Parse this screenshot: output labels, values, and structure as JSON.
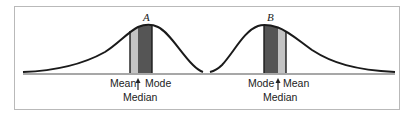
{
  "diagram": {
    "title": "",
    "colors": {
      "curve": "#1a1a1a",
      "baseline": "#8a8a8a",
      "mode_band": "#555555",
      "mean_band": "#c4c4c4",
      "frame": "#b9b9b9"
    },
    "curves": [
      {
        "id": "A",
        "label": "A",
        "skew": "negative (left-skewed)",
        "order_left_to_right": [
          "Mean",
          "Median",
          "Mode"
        ],
        "labels": {
          "mean": "Mean",
          "mode": "Mode",
          "median": "Median"
        }
      },
      {
        "id": "B",
        "label": "B",
        "skew": "positive (right-skewed)",
        "order_left_to_right": [
          "Mode",
          "Median",
          "Mean"
        ],
        "labels": {
          "mean": "Mean",
          "mode": "Mode",
          "median": "Median"
        }
      }
    ]
  }
}
